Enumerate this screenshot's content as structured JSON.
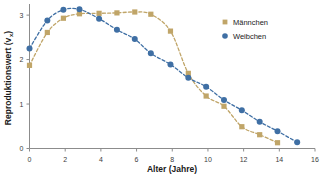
{
  "chart_data": {
    "type": "scatter",
    "title": "",
    "xlabel": "Alter (Jahre)",
    "ylabel": "Reproduktionswert (v",
    "ylabel_sub": "x",
    "ylabel_close": ")",
    "xlim": [
      0,
      16
    ],
    "ylim": [
      0,
      3.25
    ],
    "xticks": [
      0,
      2,
      4,
      6,
      8,
      10,
      12,
      14,
      16
    ],
    "xtick_labels": [
      "0",
      "2",
      "4",
      "6",
      "8",
      "10",
      "12",
      "14",
      "16"
    ],
    "yticks": [
      0,
      1,
      2,
      3
    ],
    "ytick_labels": [
      "0",
      "1",
      "2",
      "3"
    ],
    "grid": false,
    "legend_position": "top-right",
    "series": [
      {
        "name": "Männchen",
        "marker": "square",
        "color": "#c0a568",
        "line_style": "dashed",
        "x": [
          0.0,
          1.0,
          1.9,
          2.8,
          3.9,
          4.9,
          5.9,
          6.8,
          7.9,
          8.9,
          9.9,
          10.9,
          11.9,
          12.9,
          13.9
        ],
        "y": [
          1.87,
          2.61,
          2.93,
          3.03,
          3.04,
          3.05,
          3.07,
          3.02,
          2.64,
          1.69,
          1.18,
          0.95,
          0.49,
          0.31,
          0.13
        ]
      },
      {
        "name": "Weibchen",
        "marker": "circle",
        "color": "#3f6fa4",
        "line_style": "dashed",
        "x": [
          0.0,
          1.0,
          1.9,
          2.8,
          3.9,
          4.9,
          5.9,
          6.8,
          7.9,
          8.9,
          9.9,
          10.9,
          11.9,
          12.9,
          13.9,
          15.0
        ],
        "y": [
          2.25,
          2.88,
          3.12,
          3.13,
          2.92,
          2.67,
          2.46,
          2.14,
          1.89,
          1.59,
          1.39,
          1.09,
          0.86,
          0.6,
          0.39,
          0.14
        ]
      }
    ]
  },
  "legend": {
    "items": [
      {
        "label": "Männchen",
        "marker": "square",
        "color": "#c0a568"
      },
      {
        "label": "Weibchen",
        "marker": "circle",
        "color": "#3f6fa4"
      }
    ]
  },
  "colors": {
    "maennchen": "#c0a568",
    "weibchen": "#3f6fa4",
    "axis": "#8c8c8c",
    "text": "#1a1a1a",
    "background": "#ffffff"
  }
}
